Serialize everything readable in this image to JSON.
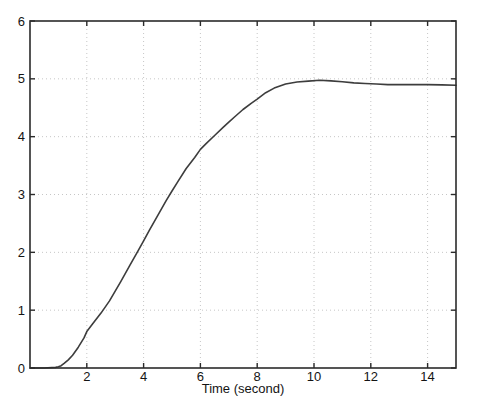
{
  "figure": {
    "kind": "matlab-style-plot",
    "background": "#ffffff"
  },
  "colors": {
    "background": "#ffffff",
    "axis": "#2b2b2b",
    "grid": "#c6c6c6",
    "line": "#3d3d3d",
    "text": "#141414"
  },
  "chart_data": {
    "type": "line",
    "title": "",
    "xlabel": "Time (second)",
    "ylabel": "",
    "xlim": [
      0,
      15
    ],
    "ylim": [
      0,
      6
    ],
    "xticks": [
      2,
      4,
      6,
      8,
      10,
      12,
      14
    ],
    "yticks": [
      0,
      1,
      2,
      3,
      4,
      5,
      6
    ],
    "grid": true,
    "grid_style": "dotted",
    "legend": null,
    "series": [
      {
        "name": "step-response",
        "x": [
          0,
          0.5,
          0.9,
          1.0,
          1.1,
          1.2,
          1.35,
          1.5,
          1.7,
          1.9,
          2.0,
          2.2,
          2.5,
          2.8,
          3.0,
          3.2,
          3.5,
          3.8,
          4.0,
          4.2,
          4.5,
          4.8,
          5.0,
          5.2,
          5.5,
          5.8,
          6.0,
          6.2,
          6.5,
          6.8,
          7.0,
          7.2,
          7.5,
          7.8,
          8.0,
          8.3,
          8.6,
          9.0,
          9.4,
          9.8,
          10.2,
          10.6,
          11.0,
          11.4,
          11.8,
          12.2,
          12.6,
          13.0,
          13.5,
          14.0,
          14.5,
          15.0
        ],
        "y": [
          0,
          0,
          0.01,
          0.02,
          0.04,
          0.08,
          0.14,
          0.22,
          0.36,
          0.52,
          0.63,
          0.76,
          0.95,
          1.16,
          1.33,
          1.5,
          1.76,
          2.02,
          2.2,
          2.38,
          2.64,
          2.9,
          3.06,
          3.22,
          3.45,
          3.64,
          3.78,
          3.88,
          4.02,
          4.16,
          4.25,
          4.34,
          4.47,
          4.58,
          4.65,
          4.76,
          4.84,
          4.91,
          4.945,
          4.96,
          4.975,
          4.965,
          4.95,
          4.93,
          4.92,
          4.91,
          4.9,
          4.9,
          4.9,
          4.9,
          4.895,
          4.89
        ]
      }
    ]
  }
}
